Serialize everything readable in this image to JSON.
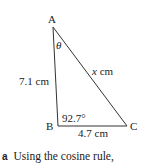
{
  "diagram": {
    "type": "triangle",
    "vertices": {
      "A": {
        "label": "A"
      },
      "B": {
        "label": "B"
      },
      "C": {
        "label": "C"
      }
    },
    "angle_at_A": "θ",
    "angle_at_B": "92.7°",
    "side_AB": "7.1 cm",
    "side_BC": "4.7 cm",
    "side_AC_var": "x",
    "side_AC_unit": " cm"
  },
  "question": {
    "letter": "a",
    "text": "Using the cosine rule,"
  }
}
